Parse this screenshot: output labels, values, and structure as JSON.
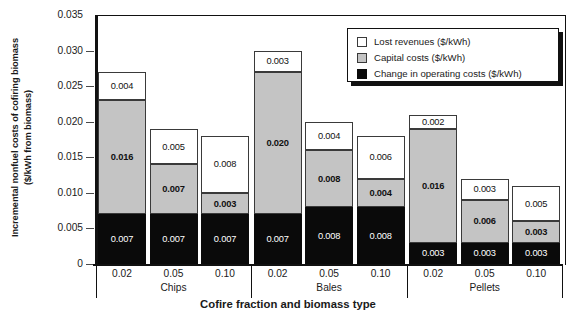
{
  "chart_data": {
    "type": "bar",
    "stacked": true,
    "title": "",
    "xlabel": "Cofire fraction and biomass type",
    "ylabel": "Incremental nonfuel costs of cofiring biomass\n($/kWh from biomass)",
    "ylim": [
      0,
      0.035
    ],
    "yticks": [
      "0",
      "0.005",
      "0.010",
      "0.015",
      "0.020",
      "0.025",
      "0.030",
      "0.035"
    ],
    "ytick_values": [
      0,
      0.005,
      0.01,
      0.015,
      0.02,
      0.025,
      0.03,
      0.035
    ],
    "grid": false,
    "legend_position": "top-right",
    "categories": [
      "0.02",
      "0.05",
      "0.10",
      "0.02",
      "0.05",
      "0.10",
      "0.02",
      "0.05",
      "0.10"
    ],
    "groups": [
      {
        "label": "Chips",
        "categories": [
          "0.02",
          "0.05",
          "0.10"
        ]
      },
      {
        "label": "Bales",
        "categories": [
          "0.02",
          "0.05",
          "0.10"
        ]
      },
      {
        "label": "Pellets",
        "categories": [
          "0.02",
          "0.05",
          "0.10"
        ]
      }
    ],
    "series": [
      {
        "name": "Change in operating costs ($/kWh)",
        "color": "#0a0a0a",
        "values": [
          0.007,
          0.007,
          0.007,
          0.007,
          0.008,
          0.008,
          0.003,
          0.003,
          0.003
        ],
        "labels": [
          "0.007",
          "0.007",
          "0.007",
          "0.007",
          "0.008",
          "0.008",
          "0.003",
          "0.003",
          "0.003"
        ]
      },
      {
        "name": "Capital costs ($/kWh)",
        "color": "#c4c4c4",
        "values": [
          0.016,
          0.007,
          0.003,
          0.02,
          0.008,
          0.004,
          0.016,
          0.006,
          0.003
        ],
        "labels": [
          "0.016",
          "0.007",
          "0.003",
          "0.020",
          "0.008",
          "0.004",
          "0.016",
          "0.006",
          "0.003"
        ]
      },
      {
        "name": "Lost revenues ($/kWh)",
        "color": "#ffffff",
        "values": [
          0.004,
          0.005,
          0.008,
          0.003,
          0.004,
          0.006,
          0.002,
          0.003,
          0.005
        ],
        "labels": [
          "0.004",
          "0.005",
          "0.008",
          "0.003",
          "0.004",
          "0.006",
          "0.002",
          "0.003",
          "0.005"
        ]
      }
    ],
    "totals": [
      0.027,
      0.019,
      0.018,
      0.03,
      0.02,
      0.018,
      0.021,
      0.012,
      0.011
    ]
  },
  "legend": {
    "entries": [
      {
        "label": "Lost revenues ($/kWh)",
        "swatch": "lost"
      },
      {
        "label": "Capital costs ($/kWh)",
        "swatch": "capital"
      },
      {
        "label": "Change in operating costs ($/kWh)",
        "swatch": "oper"
      }
    ]
  }
}
